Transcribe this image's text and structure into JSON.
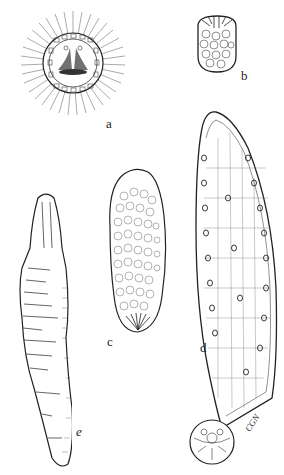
{
  "figure": {
    "panels": [
      {
        "id": "a",
        "label": "a",
        "description": "spherical ciliated larva with radiating cilia"
      },
      {
        "id": "b",
        "label": "b",
        "description": "small oval cell-filled larva"
      },
      {
        "id": "c",
        "label": "c",
        "description": "ovoid cell-filled body"
      },
      {
        "id": "d",
        "label": "d",
        "description": "elongate sac with attached spherical body"
      },
      {
        "id": "e",
        "label": "e",
        "description": "elongate wrinkled worm-like body"
      }
    ],
    "signature": "CGN",
    "colors": {
      "ink": "#222222",
      "background": "#ffffff"
    }
  }
}
